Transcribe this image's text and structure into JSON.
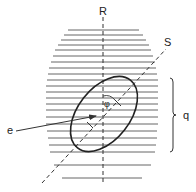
{
  "diagram": {
    "labels": {
      "axis_r": "R",
      "axis_s": "S",
      "angle": "φ",
      "ellipse_pointer": "e",
      "brace": "q"
    },
    "colors": {
      "line": "#333333",
      "hatch": "#555555",
      "background": "#ffffff"
    },
    "hatch_lines": [
      {
        "y": 30,
        "x1": 68,
        "x2": 139
      },
      {
        "y": 35,
        "x1": 64,
        "x2": 143
      },
      {
        "y": 40,
        "x1": 61,
        "x2": 146
      },
      {
        "y": 45,
        "x1": 58,
        "x2": 149
      },
      {
        "y": 50,
        "x1": 55,
        "x2": 151
      },
      {
        "y": 56,
        "x1": 53,
        "x2": 153
      },
      {
        "y": 62,
        "x1": 51,
        "x2": 155
      },
      {
        "y": 68,
        "x1": 49,
        "x2": 156
      },
      {
        "y": 74,
        "x1": 48,
        "x2": 157
      },
      {
        "y": 80,
        "x1": 47,
        "x2": 158
      },
      {
        "y": 86,
        "x1": 46,
        "x2": 158
      },
      {
        "y": 92,
        "x1": 46,
        "x2": 158
      },
      {
        "y": 98,
        "x1": 46,
        "x2": 158
      },
      {
        "y": 104,
        "x1": 46,
        "x2": 158
      },
      {
        "y": 110,
        "x1": 46,
        "x2": 158
      },
      {
        "y": 117,
        "x1": 46,
        "x2": 158
      },
      {
        "y": 124,
        "x1": 46,
        "x2": 158
      },
      {
        "y": 131,
        "x1": 47,
        "x2": 157
      },
      {
        "y": 138,
        "x1": 48,
        "x2": 157
      },
      {
        "y": 145,
        "x1": 49,
        "x2": 156
      },
      {
        "y": 152,
        "x1": 50,
        "x2": 155
      },
      {
        "y": 165,
        "x1": 54,
        "x2": 151
      },
      {
        "y": 178,
        "x1": 62,
        "x2": 142
      }
    ],
    "axis_r": {
      "x": 103,
      "y1": 17,
      "y2": 184
    },
    "axis_s": {
      "x1": 42,
      "y1": 183,
      "x2": 166,
      "y2": 49
    },
    "ellipse": {
      "cx": 104,
      "cy": 114,
      "rx": 26,
      "ry": 43,
      "rotate": 38
    },
    "brace": {
      "x": 173,
      "y1": 78,
      "y2": 152
    },
    "arrow_e": {
      "x1": 16,
      "y1": 131,
      "x2": 96,
      "y2": 116
    }
  }
}
